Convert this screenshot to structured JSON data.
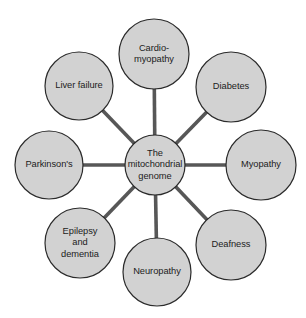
{
  "diagram": {
    "type": "hub-and-spoke",
    "background_color": "#ffffff",
    "node_fill_color": "#d2d2d2",
    "node_stroke_color": "#2b2b2b",
    "connector_color": "#575757",
    "label_color": "#1c1c1c",
    "center": {
      "id": "center-node",
      "label": "The\nmitochondrial\ngenome",
      "cx": 155,
      "cy": 165,
      "r": 30
    },
    "nodes": [
      {
        "id": "node-cardiomyopathy",
        "label": "Cardio-\nmyopathy",
        "cx": 154,
        "cy": 54,
        "r": 35,
        "position": "top"
      },
      {
        "id": "node-diabetes",
        "label": "Diabetes",
        "cx": 231,
        "cy": 87,
        "r": 35,
        "position": "top-right"
      },
      {
        "id": "node-myopathy",
        "label": "Myopathy",
        "cx": 261,
        "cy": 165,
        "r": 35,
        "position": "right"
      },
      {
        "id": "node-deafness",
        "label": "Deafness",
        "cx": 231,
        "cy": 245,
        "r": 35,
        "position": "bottom-right"
      },
      {
        "id": "node-neuropathy",
        "label": "Neuropathy",
        "cx": 157,
        "cy": 272,
        "r": 34,
        "position": "bottom"
      },
      {
        "id": "node-epilepsy-dementia",
        "label": "Epilepsy\nand\ndementia",
        "cx": 80,
        "cy": 243,
        "r": 35,
        "position": "bottom-left"
      },
      {
        "id": "node-parkinsons",
        "label": "Parkinson's",
        "cx": 49,
        "cy": 165,
        "r": 34,
        "position": "left"
      },
      {
        "id": "node-liver-failure",
        "label": "Liver failure",
        "cx": 79,
        "cy": 86,
        "r": 34,
        "position": "top-left"
      }
    ],
    "connectors": [
      {
        "id": "connector-cardiomyopathy",
        "from": "center-node",
        "to": "node-cardiomyopathy"
      },
      {
        "id": "connector-diabetes",
        "from": "center-node",
        "to": "node-diabetes"
      },
      {
        "id": "connector-myopathy",
        "from": "center-node",
        "to": "node-myopathy"
      },
      {
        "id": "connector-deafness",
        "from": "center-node",
        "to": "node-deafness"
      },
      {
        "id": "connector-neuropathy",
        "from": "center-node",
        "to": "node-neuropathy"
      },
      {
        "id": "connector-epilepsy-dementia",
        "from": "center-node",
        "to": "node-epilepsy-dementia"
      },
      {
        "id": "connector-parkinsons",
        "from": "center-node",
        "to": "node-parkinsons"
      },
      {
        "id": "connector-liver-failure",
        "from": "center-node",
        "to": "node-liver-failure"
      }
    ]
  }
}
